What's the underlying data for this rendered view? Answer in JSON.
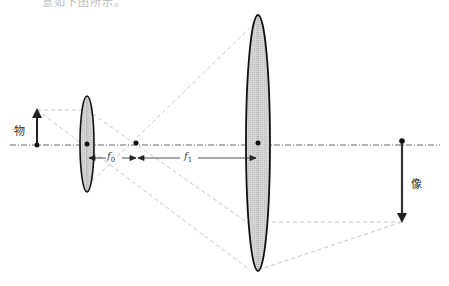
{
  "caption": "意如下图所示。",
  "labels": {
    "object": "物",
    "image": "像",
    "f0": "f",
    "f0_sub": "0",
    "f1": "f",
    "f1_sub": "1"
  },
  "colors": {
    "lens_fill": "#d4d4d4",
    "lens_stroke": "#111111",
    "ray": "#c8c8c8",
    "axis": "#333333",
    "arrow": "#222222"
  },
  "elements": {
    "optical_axis_y": 146,
    "small_lens": {
      "cx": 87,
      "cy": 144,
      "rx": 7,
      "ry": 48
    },
    "large_lens": {
      "cx": 258,
      "cy": 143,
      "rx": 12,
      "ry": 128
    },
    "focal_point": {
      "x": 136,
      "y": 144
    },
    "object": {
      "x": 37,
      "top": 110,
      "bottom": 146
    },
    "image": {
      "x": 402,
      "top": 141,
      "bottom": 222
    }
  }
}
